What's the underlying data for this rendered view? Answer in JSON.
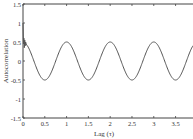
{
  "chart_data": {
    "type": "line",
    "title": "",
    "xlabel": "Lag (τ)",
    "ylabel": "Autocorrelation",
    "xlim": [
      0,
      3.9
    ],
    "ylim": [
      -1.5,
      1.5
    ],
    "xticks": [
      0,
      0.5,
      1,
      1.5,
      2,
      2.5,
      3,
      3.5
    ],
    "xtick_labels": [
      "0",
      "0.5",
      "1",
      "1.5",
      "2",
      "2.5",
      "3",
      "3.5"
    ],
    "yticks": [
      -1.5,
      -1,
      -0.5,
      0,
      0.5,
      1,
      1.5
    ],
    "ytick_labels": [
      "-1.5",
      "-1",
      "-0.5",
      "0",
      "0.5",
      "1",
      "1.5"
    ],
    "grid": false,
    "legend": null,
    "series": [
      {
        "name": "autocorrelation",
        "color": "#555555",
        "description": "Damped-start oscillation: sharp spike near lag 0 reaching ~1.0, noisy around 0.5 for lag < 0.1, then a sinusoid with period 1 and amplitude 0.5",
        "x": [
          0,
          0.01,
          0.02,
          0.03,
          0.04,
          0.05,
          0.06,
          0.08,
          0.1,
          0.25,
          0.5,
          0.75,
          1.0,
          1.25,
          1.5,
          1.75,
          2.0,
          2.25,
          2.5,
          2.75,
          3.0,
          3.25,
          3.5,
          3.75,
          3.9
        ],
        "y": [
          1.0,
          0.45,
          0.6,
          0.35,
          0.55,
          0.4,
          0.5,
          0.42,
          0.4,
          0.0,
          -0.5,
          0.0,
          0.5,
          0.0,
          -0.5,
          0.0,
          0.5,
          0.0,
          -0.5,
          0.0,
          0.5,
          0.0,
          -0.5,
          0.0,
          0.3
        ]
      }
    ]
  }
}
